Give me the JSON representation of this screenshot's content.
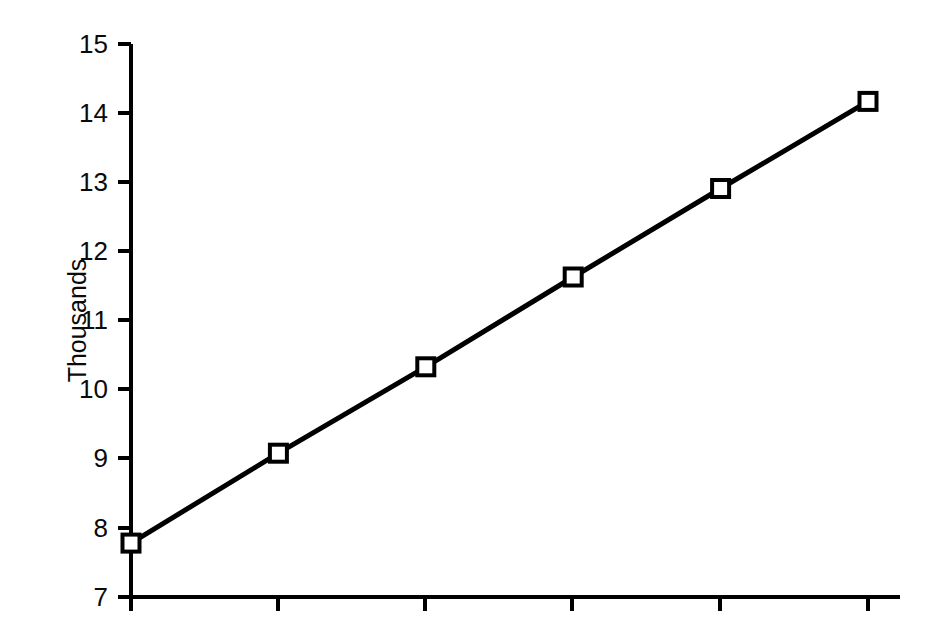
{
  "chart_data": {
    "type": "line",
    "title": "",
    "subtitle": "",
    "xlabel": "",
    "ylabel": "Thousands",
    "x": [
      1,
      2,
      3,
      4,
      5,
      6
    ],
    "values": [
      7.78,
      9.08,
      10.33,
      11.63,
      12.91,
      14.17
    ],
    "series": [
      {
        "name": "series-1",
        "values": [
          7.78,
          9.08,
          10.33,
          11.63,
          12.91,
          14.17
        ],
        "marker": "open-square",
        "line_color": "#000000",
        "line_width": 4
      }
    ],
    "ylim": [
      7,
      15
    ],
    "yticks": [
      7,
      8,
      9,
      10,
      11,
      12,
      13,
      14,
      15
    ],
    "ytick_labels": [
      "7",
      "8",
      "9",
      "10",
      "11",
      "12",
      "13",
      "14",
      "15"
    ],
    "xticks": [
      1,
      2,
      3,
      4,
      5,
      6
    ],
    "xtick_labels": [
      "",
      "",
      "",
      "",
      "",
      ""
    ],
    "grid": false,
    "legend": false,
    "legend_position": "none"
  },
  "axes": {
    "y_axis_title": "Thousands",
    "y_tick_labels": [
      "15",
      "14",
      "13",
      "12",
      "11",
      "10",
      "9",
      "8",
      "7"
    ],
    "axis_color": "#000000",
    "background_color": "#ffffff"
  },
  "colors": {
    "line": "#000000",
    "marker_fill": "#ffffff",
    "marker_stroke": "#000000",
    "axis": "#000000",
    "text": "#0a0a0a",
    "background": "#ffffff"
  }
}
